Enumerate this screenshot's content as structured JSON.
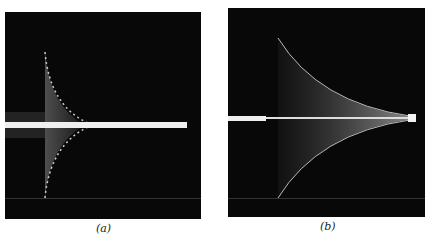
{
  "figure": {
    "panels": [
      {
        "id": "a",
        "caption": "(a)",
        "description": "oscilloscope trace: bright horizontal line with a cusp-shaped envelope opening to the left, narrowing sharply near left-center"
      },
      {
        "id": "b",
        "caption": "(b)",
        "description": "oscilloscope trace: thin horizontal line with a symmetric envelope spreading from right edge toward the left-center"
      }
    ],
    "colors": {
      "background": "#080808",
      "trace": "#f2f2f2",
      "page": "#ffffff"
    }
  }
}
